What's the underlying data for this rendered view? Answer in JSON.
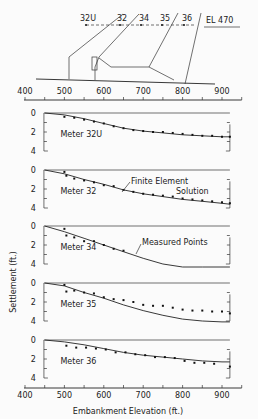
{
  "chart_data": {
    "type": "line",
    "title": "",
    "xlabel": "Embankment Elevation (ft.)",
    "ylabel": "Settlement (ft.)",
    "xlim": [
      400,
      950
    ],
    "x_ticks": [
      400,
      500,
      600,
      700,
      800,
      900
    ],
    "y_ticks": [
      0,
      2,
      4
    ],
    "ylim": [
      0,
      4
    ],
    "y_inverted": true,
    "legend": {
      "line": "Finite Element Solution",
      "points": "Measured Points"
    },
    "panels": [
      {
        "name": "Meter 32U",
        "line": {
          "x": [
            450,
            500,
            550,
            600,
            650,
            700,
            750,
            800,
            850,
            900,
            920
          ],
          "y": [
            0,
            0.2,
            0.6,
            1.1,
            1.6,
            1.9,
            2.1,
            2.3,
            2.4,
            2.5,
            2.5
          ]
        },
        "points": {
          "x": [
            500,
            525,
            550,
            575,
            600,
            625,
            650,
            675,
            700,
            725,
            750,
            775,
            800,
            825,
            850,
            875,
            900,
            920
          ],
          "y": [
            0.4,
            0.5,
            0.7,
            0.9,
            1.1,
            1.4,
            1.6,
            1.8,
            1.9,
            2.0,
            2.0,
            2.1,
            2.2,
            2.3,
            2.4,
            2.4,
            2.5,
            2.5
          ]
        }
      },
      {
        "name": "Meter 32",
        "annotation": "Finite Element Solution",
        "line": {
          "x": [
            450,
            500,
            550,
            600,
            650,
            700,
            750,
            800,
            850,
            900,
            920
          ],
          "y": [
            0,
            0.4,
            1.0,
            1.5,
            2.1,
            2.5,
            2.8,
            3.1,
            3.3,
            3.5,
            3.6
          ]
        },
        "points": {
          "x": [
            500,
            505,
            525,
            550,
            575,
            600,
            625,
            650,
            675,
            700,
            725,
            750,
            775,
            800,
            825,
            850,
            875,
            900,
            920
          ],
          "y": [
            0.2,
            0.6,
            0.9,
            1.1,
            1.3,
            1.6,
            1.7,
            2.1,
            2.3,
            2.5,
            2.6,
            2.7,
            2.8,
            3.0,
            3.1,
            3.2,
            3.3,
            3.4,
            3.5
          ]
        }
      },
      {
        "name": "Meter 34",
        "annotation": "Measured Points",
        "line": {
          "x": [
            450,
            500,
            550,
            600,
            650,
            700,
            750,
            800,
            850,
            900,
            920
          ],
          "y": [
            0,
            0.6,
            1.3,
            2.0,
            2.7,
            3.4,
            4.0,
            4.5,
            4.8,
            5.0,
            5.0
          ]
        },
        "points": {
          "x": [
            500,
            505,
            525,
            550,
            575,
            600,
            625,
            650
          ],
          "y": [
            0.3,
            1.0,
            1.2,
            1.6,
            1.6,
            2.0,
            2.4,
            2.6
          ]
        }
      },
      {
        "name": "Meter 35",
        "line": {
          "x": [
            450,
            500,
            550,
            600,
            650,
            700,
            750,
            800,
            850,
            900,
            920
          ],
          "y": [
            0,
            0.3,
            1.0,
            1.6,
            2.3,
            2.9,
            3.4,
            3.8,
            4.0,
            4.1,
            4.1
          ]
        },
        "points": {
          "x": [
            500,
            505,
            525,
            550,
            575,
            600,
            625,
            650,
            675,
            700,
            725,
            750,
            775,
            800,
            825,
            850,
            875,
            900,
            920
          ],
          "y": [
            0.2,
            0.9,
            0.8,
            1.0,
            1.1,
            1.5,
            1.7,
            1.8,
            2.0,
            2.3,
            2.4,
            2.4,
            2.6,
            2.8,
            2.9,
            2.9,
            3.0,
            3.0,
            3.2
          ]
        }
      },
      {
        "name": "Meter 36",
        "line": {
          "x": [
            450,
            500,
            550,
            600,
            650,
            700,
            750,
            800,
            850,
            900,
            920
          ],
          "y": [
            0,
            0.2,
            0.5,
            0.9,
            1.3,
            1.6,
            1.8,
            2.0,
            2.2,
            2.3,
            2.3
          ]
        },
        "points": {
          "x": [
            505,
            530,
            555,
            580,
            605,
            630,
            655,
            680,
            705,
            730,
            755,
            780,
            805,
            830,
            855,
            880,
            920
          ],
          "y": [
            0.6,
            0.8,
            0.8,
            0.9,
            1.0,
            1.3,
            1.3,
            1.5,
            1.6,
            1.8,
            1.8,
            1.9,
            2.2,
            2.4,
            2.4,
            2.5,
            2.8
          ]
        }
      }
    ]
  },
  "diagram": {
    "meter_labels": [
      "32U",
      "32",
      "34",
      "35",
      "36"
    ],
    "elevation_label": "EL 470"
  },
  "labels": {
    "ylabel": "Settlement (ft.)",
    "xlabel": "Embankment Elevation (ft.)",
    "fe_solution_line1": "Finite Element",
    "fe_solution_line2": "Solution",
    "measured_points": "Measured Points"
  }
}
